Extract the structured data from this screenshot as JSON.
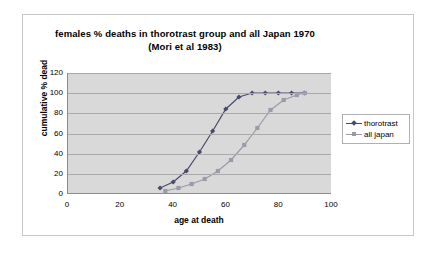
{
  "chart_data": {
    "type": "line",
    "title": "females % deaths in thorotrast group and all Japan 1970",
    "subtitle": "(Mori et al 1983)",
    "xlabel": "age at death",
    "ylabel": "cumulative % dead",
    "xlim": [
      0,
      100
    ],
    "ylim": [
      0,
      120
    ],
    "xticks": [
      0,
      20,
      40,
      60,
      80,
      100
    ],
    "yticks": [
      0,
      20,
      40,
      60,
      80,
      100,
      120
    ],
    "grid": true,
    "legend_position": "right",
    "series": [
      {
        "name": "thorotrast",
        "color": "#4a4a6a",
        "marker": "diamond",
        "points": [
          {
            "x": 35,
            "y": 5
          },
          {
            "x": 40,
            "y": 11
          },
          {
            "x": 45,
            "y": 22
          },
          {
            "x": 50,
            "y": 41
          },
          {
            "x": 55,
            "y": 62
          },
          {
            "x": 60,
            "y": 84
          },
          {
            "x": 65,
            "y": 96
          },
          {
            "x": 70,
            "y": 100
          },
          {
            "x": 75,
            "y": 100
          },
          {
            "x": 80,
            "y": 100
          },
          {
            "x": 85,
            "y": 100
          },
          {
            "x": 90,
            "y": 100
          }
        ]
      },
      {
        "name": "all japan",
        "color": "#9a9aaa",
        "marker": "square",
        "points": [
          {
            "x": 37,
            "y": 2
          },
          {
            "x": 42,
            "y": 5
          },
          {
            "x": 47,
            "y": 9
          },
          {
            "x": 52,
            "y": 14
          },
          {
            "x": 57,
            "y": 22
          },
          {
            "x": 62,
            "y": 33
          },
          {
            "x": 67,
            "y": 48
          },
          {
            "x": 72,
            "y": 65
          },
          {
            "x": 77,
            "y": 83
          },
          {
            "x": 82,
            "y": 93
          },
          {
            "x": 87,
            "y": 98
          },
          {
            "x": 90,
            "y": 100
          }
        ]
      }
    ]
  },
  "legend": {
    "items": [
      {
        "label": "thorotrast"
      },
      {
        "label": "all japan"
      }
    ]
  },
  "colors": {
    "plot_background": "#d9d9d9",
    "gridline": "#a9a9a9",
    "axis": "#8c8c8c",
    "frame_border": "#c8c8c8",
    "series_thorotrast": "#4a4a6a",
    "series_all_japan": "#9a9aaa"
  }
}
